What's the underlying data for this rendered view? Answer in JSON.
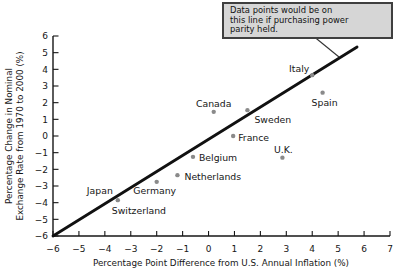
{
  "figure": {
    "annotation": {
      "line1": "Data points would be on",
      "line2": "this line if purchasing power",
      "line3": "parity held."
    },
    "colors": {
      "background": "#ffffff",
      "axis": "#161616",
      "text": "#161616",
      "point": "#8a8a8a",
      "ppp_line": "#111111",
      "callout_fill": "#d6d6d6",
      "callout_border": "#3f3f3f"
    }
  },
  "chart_data": {
    "type": "scatter",
    "title": "",
    "xlabel": "Percentage Point Difference from U.S. Annual Inflation (%)",
    "ylabel": "Percentage Change in Nominal Exchange Rate from 1970 to 2000 (%)",
    "ylabel_line1": "Percentage Change in Nominal",
    "ylabel_line2": "Exchange Rate from 1970 to 2000 (%)",
    "xlim": [
      -6,
      7
    ],
    "ylim": [
      -6,
      6
    ],
    "xticks": [
      -6,
      -5,
      -4,
      -3,
      -2,
      -1,
      0,
      1,
      2,
      3,
      4,
      5,
      6,
      7
    ],
    "yticks": [
      6,
      5,
      4,
      3,
      2,
      1,
      0,
      -1,
      -2,
      -3,
      -4,
      -5,
      -6
    ],
    "grid": false,
    "legend": false,
    "ppp_line": {
      "x1": -6,
      "y1": -6,
      "x2": 5.73,
      "y2": 5.34
    },
    "points": [
      {
        "country": "Canada",
        "x": 0.2,
        "y": 1.45,
        "marker": true,
        "anchor": "middle",
        "dx": 0,
        "dy": -5
      },
      {
        "country": "Sweden",
        "x": 1.5,
        "y": 1.55,
        "marker": true,
        "anchor": "start",
        "dx": 7,
        "dy": 13
      },
      {
        "country": "France",
        "x": 0.95,
        "y": 0.0,
        "marker": true,
        "anchor": "start",
        "dx": 5,
        "dy": 5
      },
      {
        "country": "Italy",
        "x": 4.0,
        "y": 3.65,
        "marker": true,
        "anchor": "end",
        "dx": -3,
        "dy": -3
      },
      {
        "country": "Spain",
        "x": 4.4,
        "y": 2.6,
        "marker": true,
        "anchor": "middle",
        "dx": 2,
        "dy": 13
      },
      {
        "country": "U.K.",
        "x": 2.85,
        "y": -1.3,
        "marker": true,
        "anchor": "middle",
        "dx": 1,
        "dy": -5
      },
      {
        "country": "Belgium",
        "x": -0.6,
        "y": -1.25,
        "marker": true,
        "anchor": "start",
        "dx": 6,
        "dy": 4
      },
      {
        "country": "Netherlands",
        "x": -1.2,
        "y": -2.35,
        "marker": true,
        "anchor": "start",
        "dx": 7,
        "dy": 5
      },
      {
        "country": "Germany",
        "x": -2.0,
        "y": -2.75,
        "marker": true,
        "anchor": "middle",
        "dx": -2,
        "dy": 12
      },
      {
        "country": "Japan",
        "x": -3.5,
        "y": -3.85,
        "marker": true,
        "anchor": "end",
        "dx": -5,
        "dy": -6
      },
      {
        "country": "Switzerland",
        "x": -3.5,
        "y": -3.85,
        "marker": false,
        "anchor": "start",
        "dx": -6,
        "dy": 14
      }
    ]
  }
}
